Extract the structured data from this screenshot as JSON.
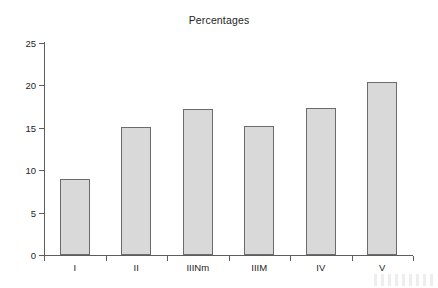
{
  "chart_data": {
    "type": "bar",
    "title": "Percentages",
    "xlabel": "",
    "ylabel": "",
    "categories": [
      "I",
      "II",
      "IIINm",
      "IIIM",
      "IV",
      "V"
    ],
    "values": [
      9.0,
      15.1,
      17.2,
      15.2,
      17.3,
      20.4
    ],
    "ylim": [
      0,
      25
    ],
    "yticks": [
      0,
      5,
      10,
      15,
      20,
      25
    ],
    "ytick_labels": [
      "0",
      "5",
      "10",
      "15",
      "20",
      "25"
    ],
    "grid": false,
    "legend": null,
    "bar_color": "#d9d9d9",
    "bar_edge_color": "#6b6b6b",
    "axis_color": "#5d5d5d",
    "background_color": "#ffffff"
  },
  "figure": {
    "title": "Percentages"
  }
}
